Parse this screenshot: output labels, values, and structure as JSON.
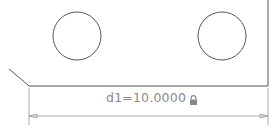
{
  "drawing": {
    "geometry": {
      "circles": [
        {
          "cx": 77,
          "cy": 36,
          "r": 24
        },
        {
          "cx": 222,
          "cy": 36,
          "r": 24
        }
      ],
      "outline_color": "#555555",
      "dimension_color": "#9a9a9a"
    },
    "dimension": {
      "name": "d1",
      "value": "10.0000",
      "label": "d1=10.0000",
      "locked": true,
      "lock_icon": "lock-icon"
    }
  }
}
